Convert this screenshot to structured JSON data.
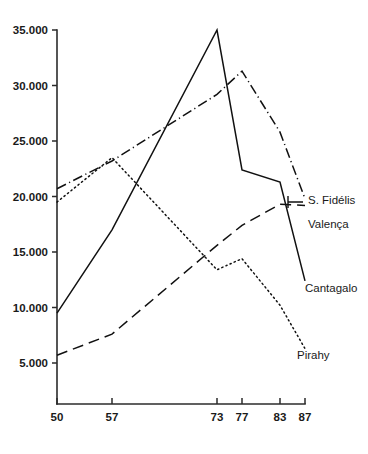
{
  "chart_data": {
    "type": "line",
    "title": "",
    "subtitle": "",
    "xlabel": "",
    "ylabel": "",
    "x": [
      50,
      57,
      73,
      77,
      83,
      87
    ],
    "xtick_labels": [
      "50",
      "57",
      "73",
      "77",
      "83",
      "87"
    ],
    "ytick_values": [
      5000,
      10000,
      15000,
      20000,
      25000,
      30000,
      35000
    ],
    "ytick_labels": [
      "5.000",
      "10.000",
      "15.000",
      "20.000",
      "25.000",
      "30.000",
      "35.000"
    ],
    "xlim": [
      50,
      87
    ],
    "ylim": [
      0,
      35000
    ],
    "grid": false,
    "legend_position": "right-inline-labels",
    "axis_color": "#2b2b2b",
    "line_color": "#111111",
    "series": [
      {
        "name": "Cantagalo",
        "style": "solid",
        "values": [
          9500,
          17000,
          35000,
          22400,
          21300,
          12400
        ]
      },
      {
        "name": "S. Fidélis",
        "style": "dash-dot",
        "values": [
          20700,
          23200,
          29200,
          31300,
          25800,
          19800
        ]
      },
      {
        "name": "Valença",
        "style": "dotted",
        "values": [
          19500,
          23500,
          13400,
          14400,
          10200,
          6300
        ]
      },
      {
        "name": "Pirahy",
        "style": "dashed",
        "values": [
          5700,
          7600,
          15600,
          17400,
          19300,
          19200
        ]
      }
    ]
  },
  "labels": {
    "s_fidelis": "S. Fidélis",
    "valenca": "Valença",
    "cantagalo": "Cantagalo",
    "pirahy": "Pirahy"
  }
}
